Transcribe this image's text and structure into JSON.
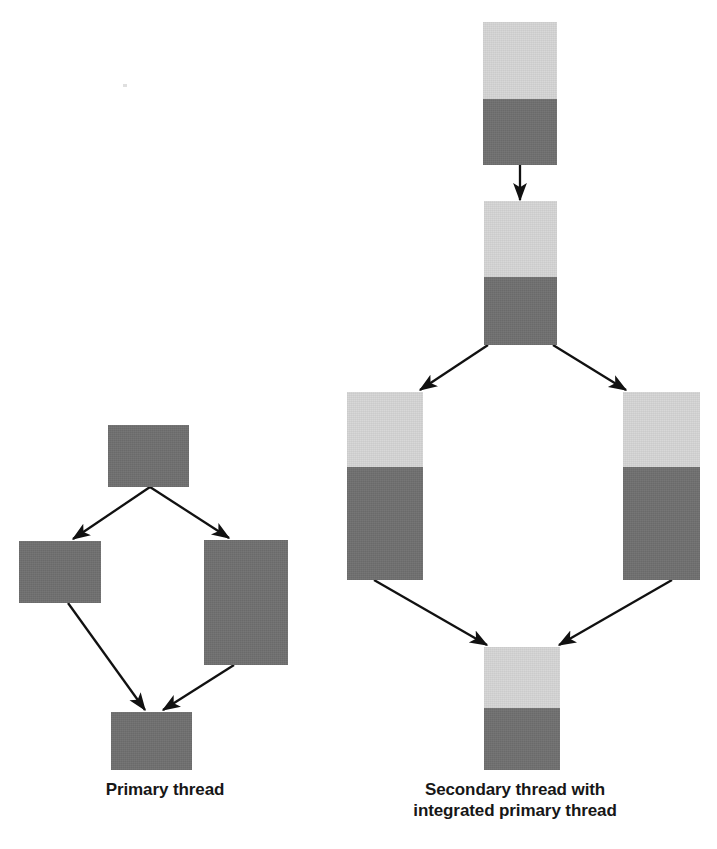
{
  "figure": {
    "background_color": "#ffffff",
    "width": 717,
    "height": 849
  },
  "colors": {
    "light_gray": "#d6d6d6",
    "dark_gray": "#707070",
    "arrow": "#111111",
    "caption_text": "#171717",
    "background": "#ffffff"
  },
  "diagrams": [
    {
      "id": "primary-thread",
      "caption_lines": [
        "Primary thread"
      ],
      "node_style": "solid-dark",
      "nodes": [
        {
          "id": "p-top",
          "name": "primary-node-top",
          "x": 108,
          "y": 425,
          "w": 81,
          "h": 62,
          "light_h": 0,
          "dark_h": 62
        },
        {
          "id": "p-left",
          "name": "primary-node-left-branch",
          "x": 19,
          "y": 541,
          "w": 82,
          "h": 62,
          "light_h": 0,
          "dark_h": 62
        },
        {
          "id": "p-right",
          "name": "primary-node-right-branch",
          "x": 204,
          "y": 540,
          "w": 84,
          "h": 125,
          "light_h": 0,
          "dark_h": 125
        },
        {
          "id": "p-bottom",
          "name": "primary-node-bottom",
          "x": 111,
          "y": 712,
          "w": 81,
          "h": 58,
          "light_h": 0,
          "dark_h": 58
        }
      ],
      "edges": [
        {
          "name": "edge-primary-top-to-left",
          "from": "p-top",
          "to": "p-left",
          "x1": 150,
          "y1": 487,
          "x2": 70,
          "y2": 541
        },
        {
          "name": "edge-primary-top-to-right",
          "from": "p-top",
          "to": "p-right",
          "x1": 150,
          "y1": 487,
          "x2": 232,
          "y2": 540
        },
        {
          "name": "edge-primary-left-to-bottom",
          "from": "p-left",
          "to": "p-bottom",
          "x1": 68,
          "y1": 603,
          "x2": 147,
          "y2": 712
        },
        {
          "name": "edge-primary-right-to-bottom",
          "from": "p-right",
          "to": "p-bottom",
          "x1": 234,
          "y1": 665,
          "x2": 160,
          "y2": 712
        }
      ]
    },
    {
      "id": "secondary-thread",
      "caption_lines": [
        "Secondary thread with",
        "integrated primary thread"
      ],
      "node_style": "two-tone",
      "nodes": [
        {
          "id": "s-top",
          "name": "secondary-node-top",
          "x": 483,
          "y": 22,
          "w": 74,
          "h": 143,
          "light_h": 77,
          "dark_h": 66
        },
        {
          "id": "s-second",
          "name": "secondary-node-second",
          "x": 484,
          "y": 201,
          "w": 73,
          "h": 144,
          "light_h": 76,
          "dark_h": 68
        },
        {
          "id": "s-left",
          "name": "secondary-node-left-branch",
          "x": 347,
          "y": 392,
          "w": 76,
          "h": 188,
          "light_h": 75,
          "dark_h": 113
        },
        {
          "id": "s-right",
          "name": "secondary-node-right-branch",
          "x": 623,
          "y": 392,
          "w": 77,
          "h": 188,
          "light_h": 75,
          "dark_h": 113
        },
        {
          "id": "s-bottom",
          "name": "secondary-node-bottom",
          "x": 484,
          "y": 647,
          "w": 76,
          "h": 123,
          "light_h": 61,
          "dark_h": 62
        }
      ],
      "edges": [
        {
          "name": "edge-secondary-top-to-second",
          "from": "s-top",
          "to": "s-second",
          "x1": 520,
          "y1": 165,
          "x2": 520,
          "y2": 201
        },
        {
          "name": "edge-secondary-second-to-left",
          "from": "s-second",
          "to": "s-left",
          "x1": 488,
          "y1": 345,
          "x2": 418,
          "y2": 392
        },
        {
          "name": "edge-secondary-second-to-right",
          "from": "s-second",
          "to": "s-right",
          "x1": 553,
          "y1": 345,
          "x2": 628,
          "y2": 392
        },
        {
          "name": "edge-secondary-left-to-bottom",
          "from": "s-left",
          "to": "s-bottom",
          "x1": 374,
          "y1": 580,
          "x2": 489,
          "y2": 647
        },
        {
          "name": "edge-secondary-right-to-bottom",
          "from": "s-right",
          "to": "s-bottom",
          "x1": 672,
          "y1": 580,
          "x2": 557,
          "y2": 647
        }
      ]
    }
  ],
  "captions": {
    "primary": {
      "line1": "Primary thread"
    },
    "secondary": {
      "line1": "Secondary thread with",
      "line2": "integrated primary thread"
    }
  }
}
